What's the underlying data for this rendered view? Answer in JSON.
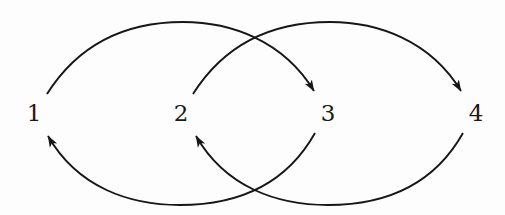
{
  "diagram": {
    "type": "directed-graph",
    "nodes": [
      {
        "id": "1",
        "label": "1",
        "x": 34,
        "y": 113
      },
      {
        "id": "2",
        "label": "2",
        "x": 181,
        "y": 113
      },
      {
        "id": "3",
        "label": "3",
        "x": 328,
        "y": 113
      },
      {
        "id": "4",
        "label": "4",
        "x": 476,
        "y": 113
      }
    ],
    "edges": [
      {
        "from": "1",
        "to": "3",
        "side": "top"
      },
      {
        "from": "2",
        "to": "4",
        "side": "top"
      },
      {
        "from": "3",
        "to": "1",
        "side": "bottom"
      },
      {
        "from": "4",
        "to": "2",
        "side": "bottom"
      }
    ],
    "colors": {
      "stroke": "#161616",
      "text": "#1a1a1a",
      "background": "#fdfdfd"
    }
  }
}
